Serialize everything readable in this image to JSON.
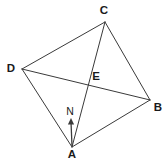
{
  "figure": {
    "type": "geometry-diagram",
    "width": 167,
    "height": 161,
    "background_color": "#ffffff",
    "stroke_color": "#3a3a3a",
    "label_color": "#1a1a1a",
    "stroke_width": 1,
    "points": [
      {
        "id": "A",
        "label": "A",
        "x": 72,
        "y": 147,
        "label_x": 72,
        "label_y": 155,
        "style": "bold"
      },
      {
        "id": "B",
        "label": "B",
        "x": 150,
        "y": 100,
        "label_x": 158,
        "label_y": 108,
        "style": "bold"
      },
      {
        "id": "C",
        "label": "C",
        "x": 105,
        "y": 22,
        "label_x": 104,
        "label_y": 11,
        "style": "bold"
      },
      {
        "id": "D",
        "label": "D",
        "x": 22,
        "y": 69,
        "label_x": 11,
        "label_y": 69,
        "style": "bold"
      },
      {
        "id": "E",
        "label": "E",
        "x": 88,
        "y": 84,
        "label_x": 96,
        "label_y": 77,
        "style": "bold"
      },
      {
        "id": "N",
        "label": "N",
        "x": 71,
        "y": 118,
        "label_x": 70,
        "label_y": 111,
        "style": "small"
      }
    ],
    "segments": [
      {
        "name": "edge-DC",
        "from": "D",
        "to": "C"
      },
      {
        "name": "edge-CB",
        "from": "C",
        "to": "B"
      },
      {
        "name": "edge-BA",
        "from": "B",
        "to": "A"
      },
      {
        "name": "edge-AD",
        "from": "A",
        "to": "D"
      },
      {
        "name": "diagonal-DB",
        "from": "D",
        "to": "B"
      },
      {
        "name": "diagonal-CA",
        "from": "C",
        "to": "A"
      }
    ],
    "arrow": {
      "name": "north-arrow",
      "from_x": 72,
      "from_y": 146,
      "to_x": 71,
      "to_y": 118,
      "label": "N"
    }
  }
}
